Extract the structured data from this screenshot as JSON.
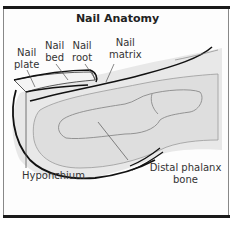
{
  "diagram": {
    "title": "Nail Anatomy",
    "labels": {
      "nail_plate": "Nail\nplate",
      "nail_bed": "Nail\nbed",
      "nail_root": "Nail\nroot",
      "nail_matrix": "Nail\nmatrix",
      "hyponchium": "Hyponchium",
      "distal_phalanx": "Distal phalanx bone"
    },
    "label_lines": {
      "nail_plate": [
        "Nail",
        "plate"
      ],
      "nail_bed": [
        "Nail",
        "bed"
      ],
      "nail_root": [
        "Nail",
        "root"
      ],
      "nail_matrix": [
        "Nail",
        "matrix"
      ]
    },
    "colors": {
      "frame_bar": "#1a1a1a",
      "outline": "#111111",
      "tissue_fill": "#e6e6e6",
      "bone_fill": "#dadada",
      "leader": "#555555"
    }
  }
}
